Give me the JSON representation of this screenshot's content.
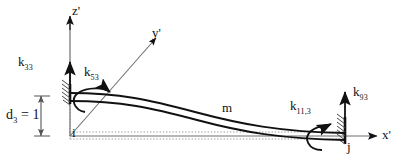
{
  "figure": {
    "background_color": "#ffffff",
    "line_color": "#111111",
    "guide_color": "#9a9a9a",
    "width": 417,
    "height": 164
  },
  "axes": {
    "x_label": "x'",
    "y_label": "y'",
    "z_label": "z'",
    "origin_node": "i"
  },
  "nodes": {
    "start": "i",
    "end": "j"
  },
  "member": {
    "label": "m"
  },
  "dimension": {
    "label_base": "d",
    "label_subscript": "3",
    "label_equals": " = 1",
    "full_text": "d3 = 1"
  },
  "stiffness": {
    "k33": {
      "base": "k",
      "sub": "33"
    },
    "k53": {
      "base": "k",
      "sub": "53"
    },
    "k93": {
      "base": "k",
      "sub": "93"
    },
    "k113": {
      "base": "k",
      "sub": "11,3"
    }
  }
}
